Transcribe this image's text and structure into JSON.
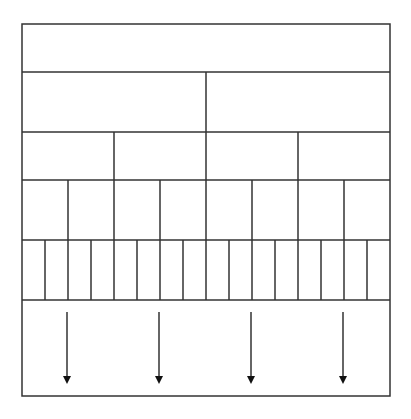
{
  "diagram": {
    "title": "",
    "stroke_color": "#333333",
    "background": "#ffffff",
    "box": {
      "x": 22,
      "y": 24,
      "width": 368,
      "height": 372
    },
    "rows": [
      {
        "name": "whole",
        "y_top": 24,
        "y_bottom": 72,
        "divisions": 1
      },
      {
        "name": "halves",
        "y_top": 72,
        "y_bottom": 132,
        "divisions": 2
      },
      {
        "name": "quarters",
        "y_top": 132,
        "y_bottom": 180,
        "divisions": 4
      },
      {
        "name": "eighths",
        "y_top": 180,
        "y_bottom": 240,
        "divisions": 8
      },
      {
        "name": "sixteenths",
        "y_top": 240,
        "y_bottom": 300,
        "divisions": 16
      },
      {
        "name": "continuation",
        "y_top": 300,
        "y_bottom": 396,
        "divisions": 1
      }
    ],
    "arrows": {
      "count": 4,
      "direction": "down",
      "y_start": 312,
      "y_end": 384,
      "icon": "arrow-down-icon"
    }
  }
}
